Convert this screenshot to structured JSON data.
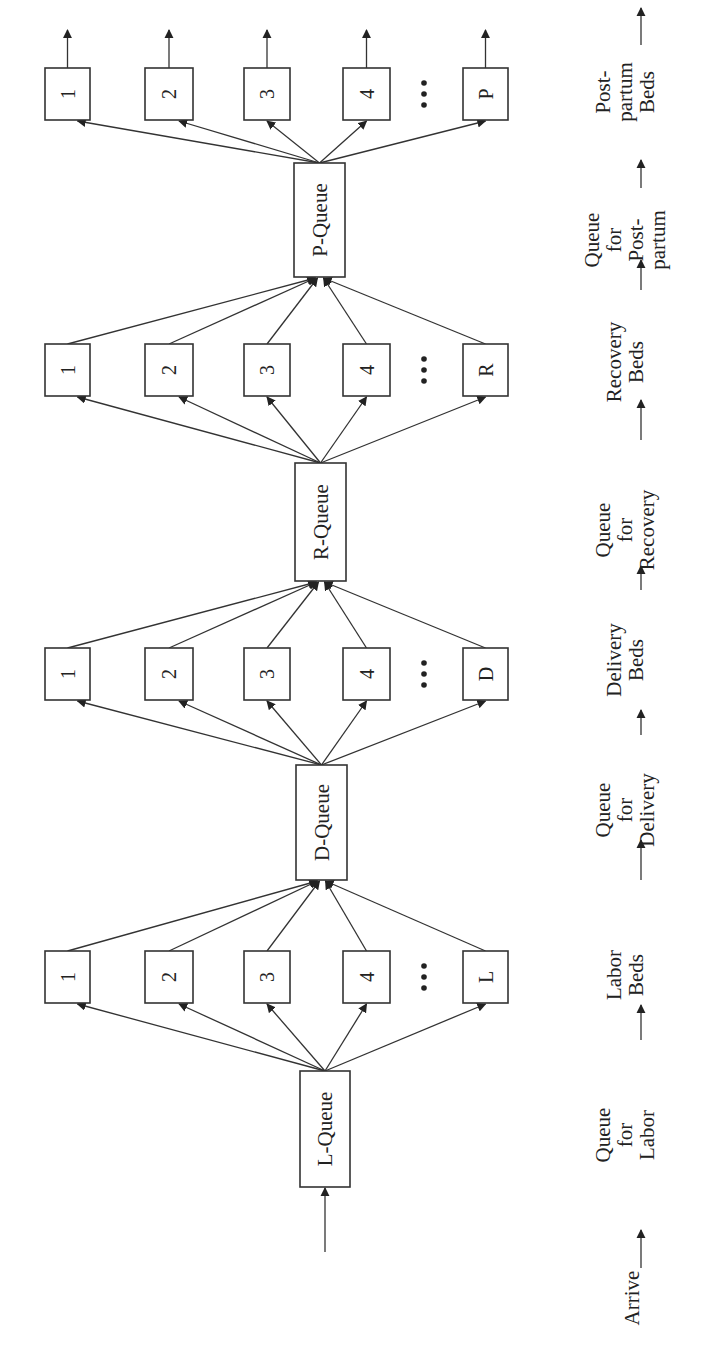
{
  "diagram": {
    "type": "queueing-network",
    "orientation": "rotated-90-ccw",
    "colors": {
      "ink": "#222222",
      "background": "#ffffff"
    },
    "stages": [
      {
        "id": "P",
        "queue_label": "P-Queue",
        "servers": [
          "1",
          "2",
          "3",
          "4",
          "P"
        ],
        "row_y": 68,
        "queue": {
          "x": 294,
          "y": 163,
          "w": 51,
          "h": 114
        }
      },
      {
        "id": "R",
        "queue_label": "R-Queue",
        "servers": [
          "1",
          "2",
          "3",
          "4",
          "R"
        ],
        "row_y": 344,
        "queue": {
          "x": 295,
          "y": 463,
          "w": 51,
          "h": 118
        }
      },
      {
        "id": "D",
        "queue_label": "D-Queue",
        "servers": [
          "1",
          "2",
          "3",
          "4",
          "D"
        ],
        "row_y": 648,
        "queue": {
          "x": 296,
          "y": 765,
          "w": 51,
          "h": 115
        }
      },
      {
        "id": "L",
        "queue_label": "L-Queue",
        "servers": [
          "1",
          "2",
          "3",
          "4",
          "L"
        ],
        "row_y": 951,
        "queue": {
          "x": 300,
          "y": 1071,
          "w": 50,
          "h": 116
        }
      }
    ],
    "ellipsis": "• • •",
    "flow_labels": [
      {
        "lines": [
          "Arrive"
        ],
        "y": 1298
      },
      {
        "lines": [
          "Queue",
          "for",
          "Labor"
        ],
        "y": 1135
      },
      {
        "lines": [
          "Labor",
          "Beds"
        ],
        "y": 975
      },
      {
        "lines": [
          "Queue",
          "for",
          "Delivery"
        ],
        "y": 810
      },
      {
        "lines": [
          "Delivery",
          "Beds"
        ],
        "y": 660
      },
      {
        "lines": [
          "Queue",
          "for",
          "Recovery"
        ],
        "y": 530
      },
      {
        "lines": [
          "Recovery",
          "Beds"
        ],
        "y": 362
      },
      {
        "lines": [
          "Queue",
          "for",
          "Post-",
          "partum"
        ],
        "y": 240
      },
      {
        "lines": [
          "Post-",
          "partum",
          "Beds"
        ],
        "y": 92
      }
    ],
    "flow_arrows_y": [
      {
        "from": 1268,
        "to": 1230
      },
      {
        "from": 1040,
        "to": 1005
      },
      {
        "from": 880,
        "to": 840
      },
      {
        "from": 735,
        "to": 710
      },
      {
        "from": 590,
        "to": 566
      },
      {
        "from": 440,
        "to": 400
      },
      {
        "from": 290,
        "to": 260
      },
      {
        "from": 188,
        "to": 160
      },
      {
        "from": 45,
        "to": 8
      }
    ]
  }
}
